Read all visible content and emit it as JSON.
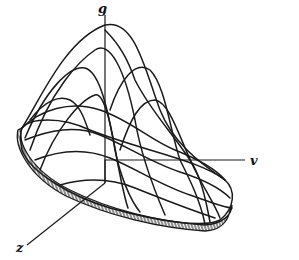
{
  "diagram": {
    "type": "3d-surface-plot",
    "axes": {
      "vertical": {
        "label": "g"
      },
      "horizontal": {
        "label": "v"
      },
      "depth": {
        "label": "z"
      }
    },
    "colors": {
      "line": "#1a1a1a",
      "background": "#ffffff"
    }
  }
}
